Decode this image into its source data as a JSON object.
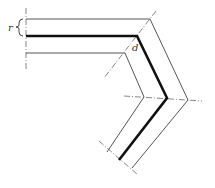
{
  "diagram": {
    "type": "bent strip cross-section (technical drawing)",
    "labels": {
      "r": "r",
      "d": "d"
    },
    "colors": {
      "line": "#555555",
      "thick_line": "#111111",
      "centerline": "#666666",
      "background": "#ffffff"
    },
    "paths": {
      "outer_edge": "M26,19 L150,19 L188,100 L132,168",
      "center_thick": "M26,36 L137,36 L167,98 L119,160",
      "inner_edge": "M26,53 L125,53 L144,97 L107,152"
    },
    "centerlines": [
      {
        "x1": 26,
        "y1": 8,
        "x2": 26,
        "y2": 70
      },
      {
        "x1": 156,
        "y1": 11,
        "x2": 104,
        "y2": 78
      },
      {
        "x1": 124,
        "y1": 96,
        "x2": 202,
        "y2": 101
      },
      {
        "x1": 99,
        "y1": 141,
        "x2": 137,
        "y2": 174
      }
    ]
  }
}
